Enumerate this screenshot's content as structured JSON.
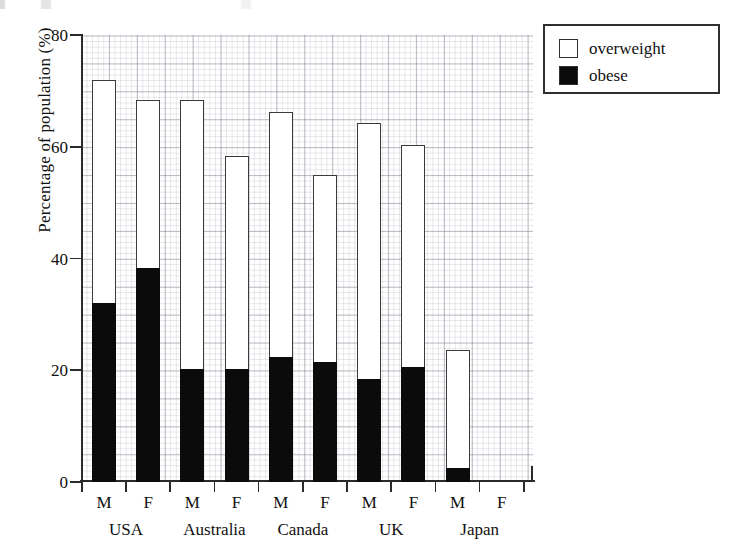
{
  "chart_data": {
    "type": "bar",
    "stacked": true,
    "title": "",
    "subtitle": "",
    "xlabel": "",
    "ylabel": "Percentage of population (%)",
    "ylim": [
      0,
      80
    ],
    "yticks": [
      0,
      20,
      40,
      60,
      80
    ],
    "ytick_labels": [
      "0",
      "20",
      "40",
      "60",
      "80"
    ],
    "grid": true,
    "grid_style": "graph-paper, minor every 1 unit, major every 5 units",
    "legend_position": "top-right, outside plot",
    "legend": [
      "overweight",
      "obese"
    ],
    "groups": [
      "USA",
      "Australia",
      "Canada",
      "UK",
      "Japan"
    ],
    "subcategories": [
      "M",
      "F"
    ],
    "categories": [
      "M",
      "F",
      "M",
      "F",
      "M",
      "F",
      "M",
      "F",
      "M",
      "F"
    ],
    "series": [
      {
        "name": "obese",
        "color": "#0b0b0b",
        "fill": "solid-black",
        "values": [
          32.0,
          38.3,
          20.3,
          20.3,
          22.3,
          21.5,
          18.5,
          20.5,
          2.5,
          null
        ]
      },
      {
        "name": "overweight",
        "color": "#ffffff",
        "fill": "hollow-white-outline",
        "note": "bar top is the combined overweight+obese total",
        "totals": [
          72.0,
          68.3,
          68.3,
          58.4,
          66.2,
          55.0,
          64.2,
          60.3,
          23.7,
          null
        ],
        "values": [
          40.0,
          30.0,
          48.0,
          38.1,
          43.9,
          33.5,
          45.7,
          39.8,
          21.2,
          null
        ]
      }
    ],
    "points": [
      {
        "group": "USA",
        "sex": "M",
        "total": 72.0,
        "obese": 32.0,
        "overweight_only": 40.0
      },
      {
        "group": "USA",
        "sex": "F",
        "total": 68.3,
        "obese": 38.3,
        "overweight_only": 30.0
      },
      {
        "group": "Australia",
        "sex": "M",
        "total": 68.3,
        "obese": 20.3,
        "overweight_only": 48.0
      },
      {
        "group": "Australia",
        "sex": "F",
        "total": 58.4,
        "obese": 20.3,
        "overweight_only": 38.1
      },
      {
        "group": "Canada",
        "sex": "M",
        "total": 66.2,
        "obese": 22.3,
        "overweight_only": 43.9
      },
      {
        "group": "Canada",
        "sex": "F",
        "total": 55.0,
        "obese": 21.5,
        "overweight_only": 33.5
      },
      {
        "group": "UK",
        "sex": "M",
        "total": 64.2,
        "obese": 18.5,
        "overweight_only": 45.7
      },
      {
        "group": "UK",
        "sex": "F",
        "total": 60.3,
        "obese": 20.5,
        "overweight_only": 39.8
      },
      {
        "group": "Japan",
        "sex": "M",
        "total": 23.7,
        "obese": 2.5,
        "overweight_only": 21.2
      },
      {
        "group": "Japan",
        "sex": "F",
        "total": null,
        "obese": null,
        "overweight_only": null
      }
    ]
  },
  "axes": {
    "y_title": "Percentage of population (%)",
    "y_tick_labels": [
      "80",
      "60",
      "40",
      "20",
      "0"
    ]
  },
  "legend": {
    "items": [
      {
        "label": "overweight",
        "swatch": "hollow"
      },
      {
        "label": "obese",
        "swatch": "filled"
      }
    ]
  },
  "group_labels": [
    "USA",
    "Australia",
    "Canada",
    "UK",
    "Japan"
  ],
  "sex_labels": [
    "M",
    "F",
    "M",
    "F",
    "M",
    "F",
    "M",
    "F",
    "M",
    "F"
  ],
  "colors": {
    "obese": "#0b0b0b",
    "overweight": "#ffffff",
    "axis": "#2a2a2a",
    "grid_major": "#78788c",
    "grid_minor": "#9696a5",
    "outline": "#3a3a3a"
  }
}
